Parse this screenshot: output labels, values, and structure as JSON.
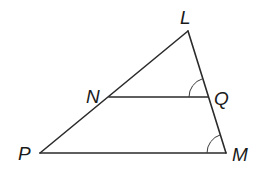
{
  "diagram": {
    "type": "triangle-with-parallel-segment",
    "vertices": {
      "L": "L",
      "N": "N",
      "Q": "Q",
      "P": "P",
      "M": "M"
    },
    "segments": [
      "LP",
      "LM",
      "PM",
      "NQ"
    ],
    "marked_angles": [
      "angle LQN",
      "angle LMP"
    ],
    "colors": {
      "line": "#2b2b2b",
      "label": "#1a1a1a",
      "background": "#ffffff"
    }
  }
}
